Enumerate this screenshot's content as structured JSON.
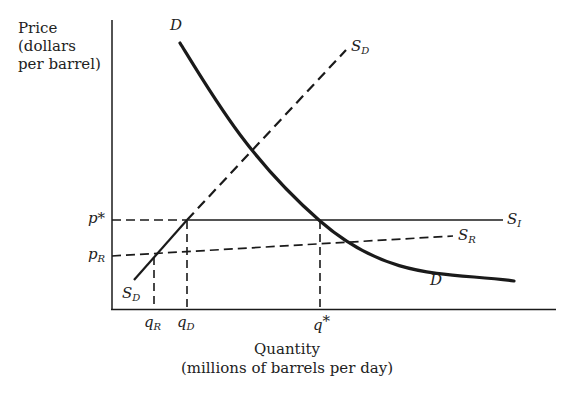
{
  "diagram": {
    "y_axis_label": [
      "Price",
      "(dollars",
      "per barrel)"
    ],
    "x_axis_label": [
      "Quantity",
      "(millions of barrels per day)"
    ],
    "price_ticks": [
      {
        "name": "p*",
        "main": "p",
        "sup": "*"
      },
      {
        "name": "p_R",
        "main": "p",
        "sub": "R"
      }
    ],
    "quantity_ticks": [
      {
        "name": "q_R",
        "main": "q",
        "sub": "R"
      },
      {
        "name": "q_D",
        "main": "q",
        "sub": "D"
      },
      {
        "name": "q*",
        "main": "q",
        "sup": "*"
      }
    ],
    "curves": [
      {
        "id": "D",
        "label": "D",
        "style": "solid-thick",
        "description": "Demand curve"
      },
      {
        "id": "S_D",
        "label": "S",
        "sub": "D",
        "style": "dashed (solid below p_R)",
        "description": "Domestic supply"
      },
      {
        "id": "S_I",
        "label": "S",
        "sub": "I",
        "style": "solid",
        "description": "Import supply at world price p*"
      },
      {
        "id": "S_R",
        "label": "S",
        "sub": "R",
        "style": "dashed",
        "description": "Supply with restriction"
      }
    ],
    "colors": {
      "line": "#1a1a1a",
      "text": "#222222",
      "background": "#ffffff"
    }
  },
  "labels": {
    "D_top": "D",
    "D_bottom": "D",
    "SD_top_main": "S",
    "SD_top_sub": "D",
    "SD_bottom_main": "S",
    "SD_bottom_sub": "D",
    "SI_main": "S",
    "SI_sub": "I",
    "SR_main": "S",
    "SR_sub": "R",
    "pstar_main": "p",
    "pstar_sup": "*",
    "pR_main": "p",
    "pR_sub": "R",
    "qR_main": "q",
    "qR_sub": "R",
    "qD_main": "q",
    "qD_sub": "D",
    "qstar_main": "q",
    "qstar_sup": "*",
    "y_line1": "Price",
    "y_line2": "(dollars",
    "y_line3": "per barrel)",
    "x_line1": "Quantity",
    "x_line2": "(millions of barrels per day)"
  }
}
